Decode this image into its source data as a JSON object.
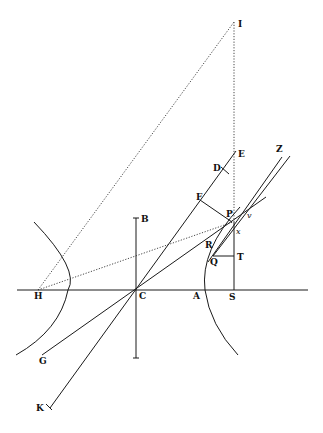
{
  "figure": {
    "type": "geometric-diagram",
    "labels": {
      "I": "I",
      "E": "E",
      "D": "D",
      "Z": "Z",
      "F": "F",
      "P": "P",
      "v": "v",
      "x": "x",
      "R": "R",
      "Q": "Q",
      "T": "T",
      "B": "B",
      "H": "H",
      "C": "C",
      "A": "A",
      "S": "S",
      "G": "G",
      "K": "K"
    }
  }
}
